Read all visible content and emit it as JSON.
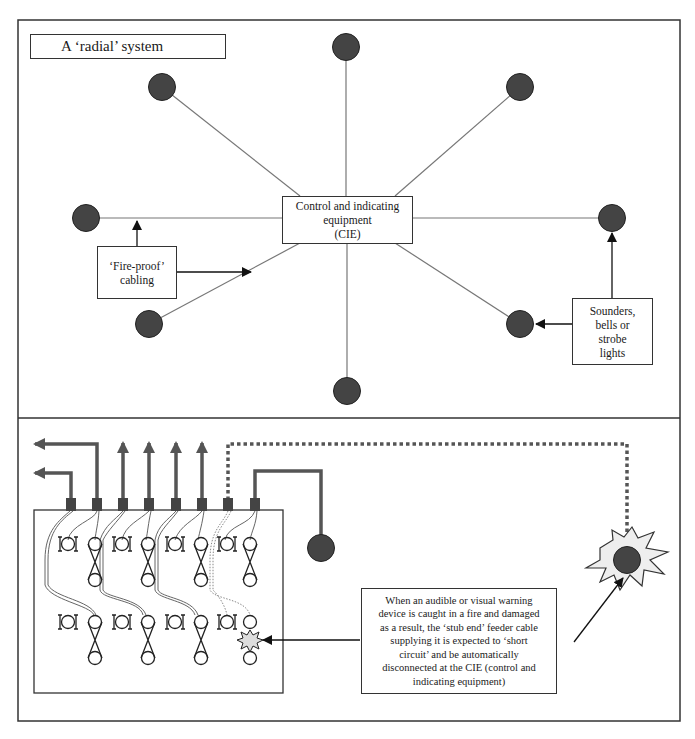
{
  "diagram": {
    "top_panel": {
      "title": "A ‘radial’ system",
      "cie_label": "Control and indicating equipment (CIE)",
      "cie_lines": [
        "Control and indicating",
        "equipment",
        "(CIE)"
      ],
      "fireproof_label": "‘Fire-proof’ cabling",
      "fireproof_lines": [
        "‘Fire-proof’",
        "cabling"
      ],
      "sounders_label": "Sounders, bells or strobe lights",
      "sounders_lines": [
        "Sounders,",
        "bells or",
        "strobe",
        "lights"
      ],
      "device_count": 8
    },
    "bottom_panel": {
      "fault_description": "When an audible or visual warning device is caught in a fire and damaged as a result, the ‘stub end’ feeder cable supplying it is expected to ‘short circuit’ and be automatically disconnected at the CIE (control and indicating equipment)",
      "fault_lines": [
        "When an audible or visual warning",
        "device is caught in a fire and damaged",
        "as a result, the ‘stub end’ feeder cable",
        "supplying it is expected to ‘short",
        "circuit’ and be automatically",
        "disconnected at the CIE (control and",
        "indicating equipment)"
      ],
      "terminal_count": 8
    },
    "colors": {
      "device_fill": "#444444",
      "line": "#777777",
      "border": "#333333",
      "cable": "#555555",
      "fire_fill": "#eeeeee"
    }
  }
}
